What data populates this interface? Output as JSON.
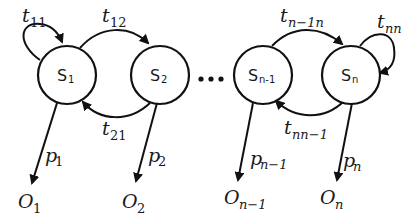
{
  "diagram": {
    "type": "hidden-markov-chain",
    "colors": {
      "stroke": "#111111",
      "text": "#1a1a1a",
      "background": "#ffffff"
    },
    "states": [
      {
        "id": "s1",
        "label": "S",
        "sub": "1"
      },
      {
        "id": "s2",
        "label": "S",
        "sub": "2"
      },
      {
        "id": "sn1",
        "label": "S",
        "sub": "n-1"
      },
      {
        "id": "sn",
        "label": "S",
        "sub": "n"
      }
    ],
    "ellipsis": "...",
    "transitions": [
      {
        "id": "t11",
        "base": "t",
        "sub": "11",
        "from": "S1",
        "to": "S1"
      },
      {
        "id": "t12",
        "base": "t",
        "sub": "12",
        "from": "S1",
        "to": "S2"
      },
      {
        "id": "t21",
        "base": "t",
        "sub": "21",
        "from": "S2",
        "to": "S1"
      },
      {
        "id": "tn1n",
        "base": "t",
        "sub": "n−1n",
        "from": "Sn-1",
        "to": "Sn"
      },
      {
        "id": "tnn",
        "base": "t",
        "sub": "nn",
        "from": "Sn",
        "to": "Sn"
      },
      {
        "id": "tnn1",
        "base": "t",
        "sub": "nn−1",
        "from": "Sn",
        "to": "Sn-1"
      }
    ],
    "emissions": [
      {
        "id": "p1",
        "base": "p",
        "sub": "1"
      },
      {
        "id": "p2",
        "base": "p",
        "sub": "2"
      },
      {
        "id": "pn1",
        "base": "p",
        "sub": "n−1"
      },
      {
        "id": "pn",
        "base": "p",
        "sub": "n"
      }
    ],
    "outputs": [
      {
        "id": "o1",
        "base": "O",
        "sub": "1"
      },
      {
        "id": "o2",
        "base": "O",
        "sub": "2"
      },
      {
        "id": "on1",
        "base": "O",
        "sub": "n−1"
      },
      {
        "id": "on",
        "base": "O",
        "sub": "n"
      }
    ]
  }
}
